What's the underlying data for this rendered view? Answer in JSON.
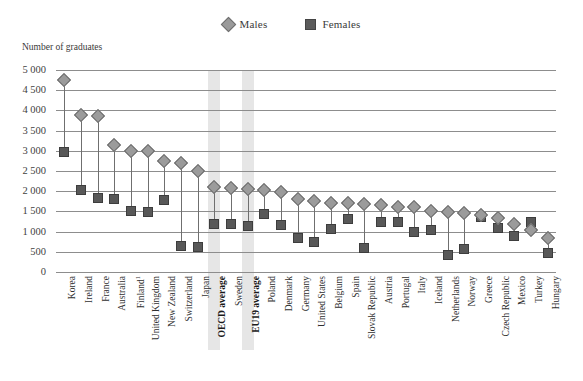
{
  "legend": {
    "males_label": "Males",
    "females_label": "Females",
    "males_icon": "diamond-marker",
    "females_icon": "square-marker"
  },
  "axis": {
    "y_title": "Number of graduates",
    "y_ticks": [
      "5 000",
      "4 500",
      "4 000",
      "3 500",
      "3 000",
      "2 500",
      "2 000",
      "1 500",
      "1 000",
      "500",
      "0"
    ]
  },
  "colors": {
    "males_marker": "#9b9b9b",
    "females_marker": "#585858",
    "gridline": "#8d8d8d",
    "highlight_band": "#e2e2e2",
    "text": "#2f2f2f"
  },
  "highlighted_categories": [
    "OECD average",
    "EU19 average"
  ],
  "chart_data": {
    "type": "scatter",
    "title": "",
    "subtitle": "",
    "xlabel": "",
    "ylabel": "Number of graduates",
    "ylim": [
      0,
      5000
    ],
    "ytick_step": 500,
    "grid": true,
    "legend_position": "top-center",
    "categories": [
      "Korea",
      "Ireland",
      "France",
      "Australia",
      "Finland¹",
      "United Kingdom",
      "New Zealand",
      "Switzerland",
      "Japan",
      "OECD average",
      "Sweden",
      "EU19 average",
      "Poland",
      "Denmark",
      "Germany",
      "United States",
      "Belgium",
      "Spain",
      "Slovak Republic",
      "Austria",
      "Portugal",
      "Italy",
      "Iceland",
      "Netherlands",
      "Norway",
      "Greece",
      "Czech Republic",
      "Mexico",
      "Turkey",
      "Hungary"
    ],
    "series": [
      {
        "name": "Males",
        "marker": "diamond",
        "values": [
          4750,
          3880,
          3850,
          3150,
          3000,
          2990,
          2750,
          2700,
          2500,
          2100,
          2080,
          2050,
          2020,
          1980,
          1800,
          1760,
          1720,
          1700,
          1690,
          1660,
          1620,
          1600,
          1500,
          1480,
          1470,
          1400,
          1330,
          1180,
          1030,
          830
        ]
      },
      {
        "name": "Females",
        "marker": "square",
        "values": [
          2970,
          2020,
          1840,
          1800,
          1520,
          1480,
          1790,
          650,
          620,
          1200,
          1180,
          1150,
          1440,
          1160,
          830,
          750,
          1060,
          1320,
          590,
          1250,
          1230,
          1000,
          1030,
          430,
          560,
          1370,
          1090,
          880,
          1250,
          470
        ]
      }
    ],
    "footnote_marker": "1"
  }
}
